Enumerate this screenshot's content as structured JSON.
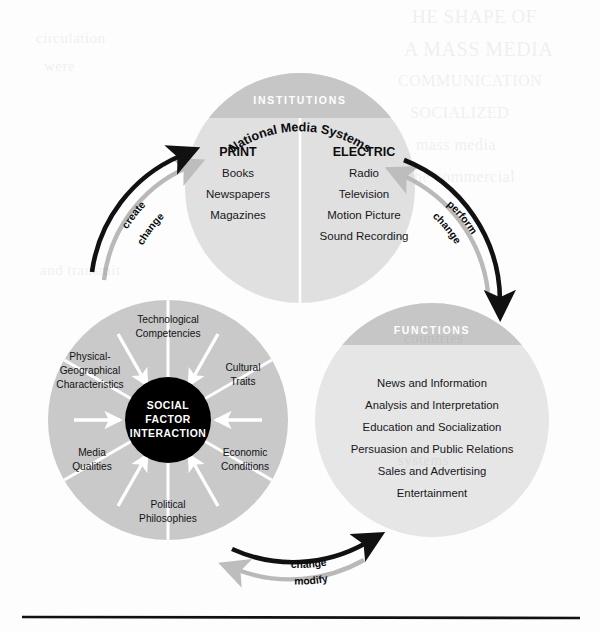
{
  "figure": {
    "title": "National Media Systems",
    "baseline_rule": true
  },
  "colors": {
    "circle_body": "#e0e0e0",
    "circle_cap": "#c6c6c6",
    "wheel_segment": "#c9c9c9",
    "hub": "#000000",
    "divider": "#ffffff",
    "arrow_primary": "#111111",
    "arrow_secondary": "#b9b9b9",
    "text": "#17171a"
  },
  "institutions": {
    "cap_label": "INSTITUTIONS",
    "columns": [
      {
        "heading": "PRINT",
        "items": [
          "Books",
          "Newspapers",
          "Magazines"
        ]
      },
      {
        "heading": "ELECTRIC",
        "items": [
          "Radio",
          "Television",
          "Motion Picture",
          "Sound Recording"
        ]
      }
    ]
  },
  "functions": {
    "cap_label": "FUNCTIONS",
    "items": [
      "News and Information",
      "Analysis and Interpretation",
      "Education and Socialization",
      "Persuasion and Public Relations",
      "Sales and Advertising",
      "Entertainment"
    ]
  },
  "social_factors": {
    "hub": [
      "SOCIAL",
      "FACTOR",
      "INTERACTION"
    ],
    "segments": [
      {
        "lines": [
          "Technological",
          "Competencies"
        ]
      },
      {
        "lines": [
          "Cultural",
          "Traits"
        ]
      },
      {
        "lines": [
          "Economic",
          "Conditions"
        ]
      },
      {
        "lines": [
          "Political",
          "Philosophies"
        ]
      },
      {
        "lines": [
          "Media",
          "Qualities"
        ]
      },
      {
        "lines": [
          "Physical-",
          "Geographical",
          "Characteristics"
        ]
      }
    ]
  },
  "flows": {
    "left": {
      "primary": "create",
      "secondary": "change"
    },
    "right": {
      "primary": "perform",
      "secondary": "change"
    },
    "bottom": {
      "primary": "change",
      "secondary": "modify"
    }
  },
  "ghost_text": {
    "lines": [
      "HE SHAPE OF",
      "A MASS MEDIA",
      "COMMUNICATION",
      "SOCIALIZED",
      "mass media",
      "he commercial",
      "circulation",
      "were",
      "and transmit",
      "countries",
      "systems"
    ]
  }
}
